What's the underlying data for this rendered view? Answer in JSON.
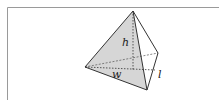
{
  "diagram": {
    "type": "triangular pyramid",
    "labels": {
      "height": "h",
      "width": "w",
      "length": "l"
    },
    "colors": {
      "face_fill": "#d6d6d6",
      "edge": "#333333",
      "frame": "#9a9a9a",
      "background": "#ffffff"
    }
  }
}
